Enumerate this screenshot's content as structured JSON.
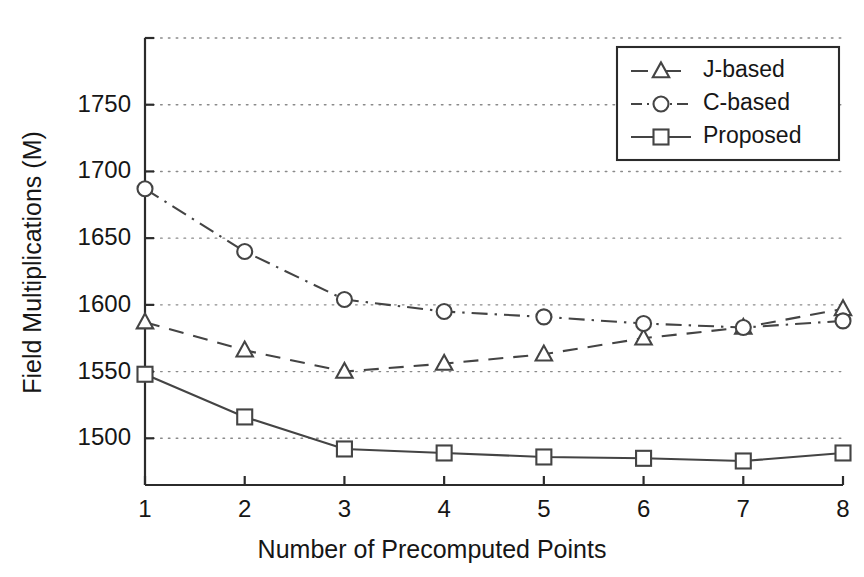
{
  "chart_data": {
    "type": "line",
    "title": "",
    "xlabel": "Number of Precomputed Points",
    "ylabel": "Field Multiplications (M)",
    "x": [
      1,
      2,
      3,
      4,
      5,
      6,
      7,
      8
    ],
    "xticklabels": [
      "1",
      "2",
      "3",
      "4",
      "5",
      "6",
      "7",
      "8"
    ],
    "yticks": [
      1500,
      1550,
      1600,
      1650,
      1700,
      1750
    ],
    "yticklabels": [
      "1500",
      "1550",
      "1600",
      "1650",
      "1700",
      "1750"
    ],
    "xlim": [
      1,
      8
    ],
    "ylim": [
      1465,
      1800
    ],
    "grid": "dotted-horizontal",
    "legend_position": "upper-right",
    "series": [
      {
        "name": "J-based",
        "marker": "triangle",
        "linestyle": "dashed",
        "color": "#444444",
        "values": [
          1587,
          1566,
          1550,
          1556,
          1563,
          1575,
          1583,
          1597
        ]
      },
      {
        "name": "C-based",
        "marker": "circle",
        "linestyle": "dash-dot",
        "color": "#444444",
        "values": [
          1687,
          1640,
          1604,
          1595,
          1591,
          1586,
          1583,
          1588
        ]
      },
      {
        "name": "Proposed",
        "marker": "square",
        "linestyle": "solid",
        "color": "#444444",
        "values": [
          1548,
          1516,
          1492,
          1489,
          1486,
          1485,
          1483,
          1489
        ]
      }
    ]
  },
  "legend": {
    "items": [
      {
        "label": "J-based"
      },
      {
        "label": "C-based"
      },
      {
        "label": "Proposed"
      }
    ]
  }
}
